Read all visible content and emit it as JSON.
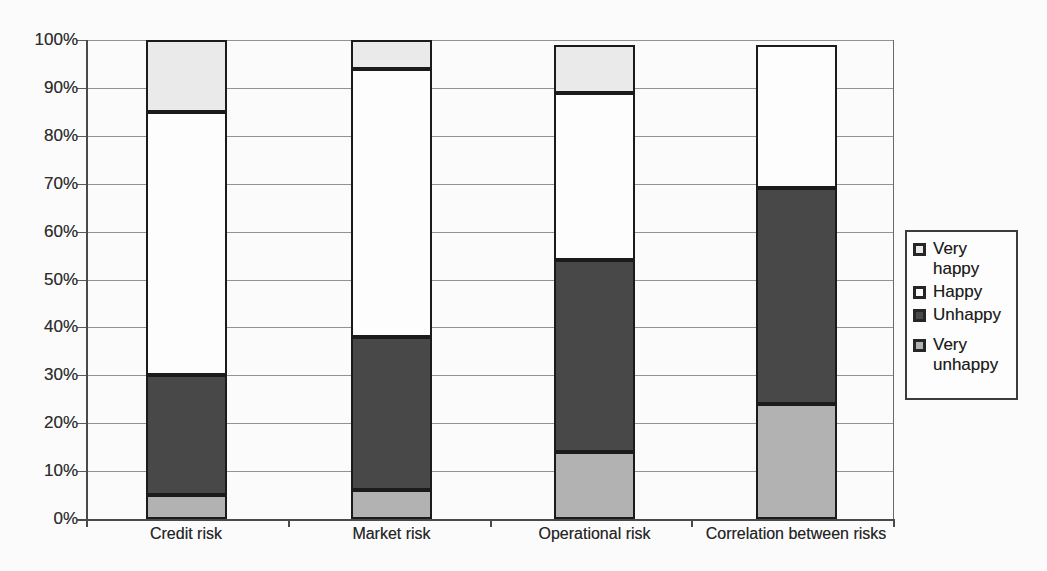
{
  "chart_data": {
    "type": "bar",
    "subtype": "stacked-100-percent-column",
    "title": "",
    "xlabel": "",
    "ylabel": "",
    "categories": [
      "Credit risk",
      "Market risk",
      "Operational risk",
      "Correlation between risks"
    ],
    "series": [
      {
        "name": "Very unhappy",
        "values": [
          5,
          6,
          14,
          24
        ],
        "color": "#b2b2b2"
      },
      {
        "name": "Unhappy",
        "values": [
          25,
          32,
          40,
          45
        ],
        "color": "#484848"
      },
      {
        "name": "Happy",
        "values": [
          55,
          56,
          35,
          30
        ],
        "color": "#fdfdfd"
      },
      {
        "name": "Very happy",
        "values": [
          15,
          6,
          10,
          0
        ],
        "color": "#eaeaea"
      }
    ],
    "ylim": [
      0,
      100
    ],
    "ytick_step": 10,
    "ytick_labels": [
      "0%",
      "10%",
      "20%",
      "30%",
      "40%",
      "50%",
      "60%",
      "70%",
      "80%",
      "90%",
      "100%"
    ],
    "grid": true,
    "legend": {
      "position": "right",
      "entries": [
        {
          "label": "Very happy",
          "color": "#eaeaea"
        },
        {
          "label": "Happy",
          "color": "#fdfdfd"
        },
        {
          "label": "Unhappy",
          "color": "#484848"
        },
        {
          "label": "Very unhappy",
          "color": "#b2b2b2"
        }
      ]
    },
    "colors": {
      "bar_border": "#1b1b1b",
      "gridline": "#929292",
      "axis": "#4a4a4a",
      "text": "#2e2e2e",
      "page_background": "#fbfbfb"
    }
  }
}
